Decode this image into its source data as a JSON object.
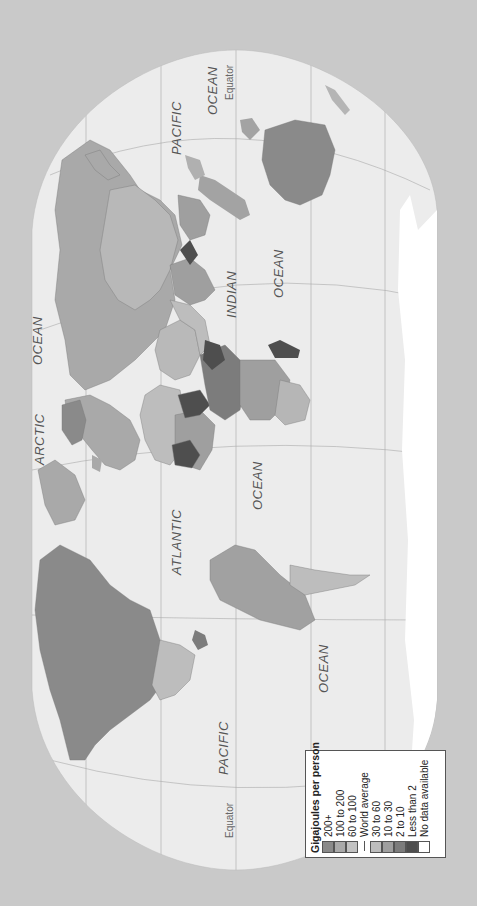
{
  "map": {
    "title": "Gigajoules per person",
    "orientation": "rotated 90 degrees counter-clockwise",
    "background_color": "#c9c9c9",
    "ocean_color": "#ececec",
    "ocean_labels": {
      "pacific_east": "PACIFIC",
      "pacific_east_ocean": "OCEAN",
      "pacific_west": "PACIFIC",
      "pacific_west_ocean": "OCEAN",
      "atlantic": "ATLANTIC",
      "atlantic_ocean": "OCEAN",
      "indian": "INDIAN",
      "indian_ocean": "OCEAN",
      "arctic": "ARCTIC",
      "arctic_ocean": "OCEAN"
    },
    "equator_label_top": "Equator",
    "equator_label_bottom": "Equator"
  },
  "legend": {
    "title": "Gigajoules per person",
    "items": [
      {
        "label": "200+",
        "color": "#8a8a8a"
      },
      {
        "label": "100 to 200",
        "color": "#a9a9a9"
      },
      {
        "label": "60 to 100",
        "color": "#c2c2c2"
      }
    ],
    "world_average_label": "World average",
    "items_below": [
      {
        "label": "30 to 60",
        "color": "#bdbdbd"
      },
      {
        "label": "10 to 30",
        "color": "#9f9f9f"
      },
      {
        "label": "2 to 10",
        "color": "#7c7c7c"
      },
      {
        "label": "Less than 2",
        "color": "#4e4e4e"
      },
      {
        "label": "No data available",
        "color": "#ffffff"
      }
    ]
  }
}
